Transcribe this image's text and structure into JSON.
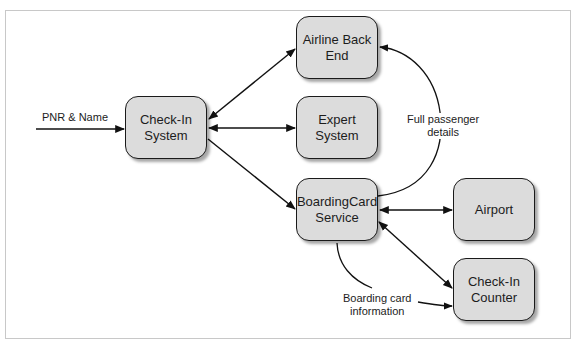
{
  "diagram": {
    "nodes": [
      {
        "id": "check_in_system",
        "label": "Check-In\nSystem"
      },
      {
        "id": "airline_back_end",
        "label": "Airline Back\nEnd"
      },
      {
        "id": "expert_system",
        "label": "Expert\nSystem"
      },
      {
        "id": "boarding_card_service",
        "label": "BoardingCard\nService"
      },
      {
        "id": "airport",
        "label": "Airport"
      },
      {
        "id": "check_in_counter",
        "label": "Check-In\nCounter"
      }
    ],
    "edge_labels": {
      "input": "PNR & Name",
      "full_passenger": "Full passenger\ndetails",
      "boarding_card_info": "Boarding card\ninformation"
    },
    "edges": [
      {
        "from": "external",
        "to": "check_in_system",
        "label": "PNR & Name",
        "direction": "forward"
      },
      {
        "from": "check_in_system",
        "to": "airline_back_end",
        "direction": "both"
      },
      {
        "from": "check_in_system",
        "to": "expert_system",
        "direction": "both"
      },
      {
        "from": "check_in_system",
        "to": "boarding_card_service",
        "direction": "forward"
      },
      {
        "from": "boarding_card_service",
        "to": "airline_back_end",
        "label": "Full passenger details",
        "direction": "forward"
      },
      {
        "from": "boarding_card_service",
        "to": "airport",
        "direction": "both"
      },
      {
        "from": "boarding_card_service",
        "to": "check_in_counter",
        "direction": "both"
      },
      {
        "from": "boarding_card_service",
        "to": "check_in_counter",
        "label": "Boarding card information",
        "direction": "forward"
      }
    ],
    "colors": {
      "node_fill": "#dcdcdc",
      "node_border": "#1a1a1a",
      "edge": "#111111",
      "frame": "#c8c8c8"
    }
  }
}
